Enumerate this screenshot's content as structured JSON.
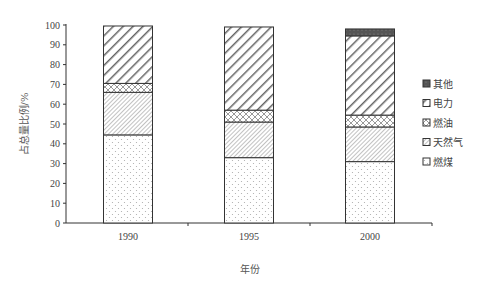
{
  "chart_data": {
    "type": "bar",
    "stacked": true,
    "title": "",
    "xlabel": "年份",
    "ylabel": "占总量比例/%",
    "ylim": [
      0,
      100
    ],
    "yticks": [
      0,
      10,
      20,
      30,
      40,
      50,
      60,
      70,
      80,
      90,
      100
    ],
    "categories": [
      "1990",
      "1995",
      "2000"
    ],
    "grid": false,
    "legend_position": "right",
    "series": [
      {
        "name": "燃煤",
        "pattern": "dots",
        "values": [
          44.5,
          33,
          31
        ]
      },
      {
        "name": "天然气",
        "pattern": "fine-diagonal",
        "values": [
          21.5,
          18,
          17.5
        ]
      },
      {
        "name": "燃油",
        "pattern": "crosshatch",
        "values": [
          4.5,
          6,
          6
        ]
      },
      {
        "name": "电力",
        "pattern": "wide-diagonal",
        "values": [
          29,
          42,
          40
        ]
      },
      {
        "name": "其他",
        "pattern": "dark-solid",
        "values": [
          0,
          0,
          3.5
        ]
      }
    ],
    "legend": [
      "其他",
      "电力",
      "燃油",
      "天然气",
      "燃煤"
    ]
  }
}
